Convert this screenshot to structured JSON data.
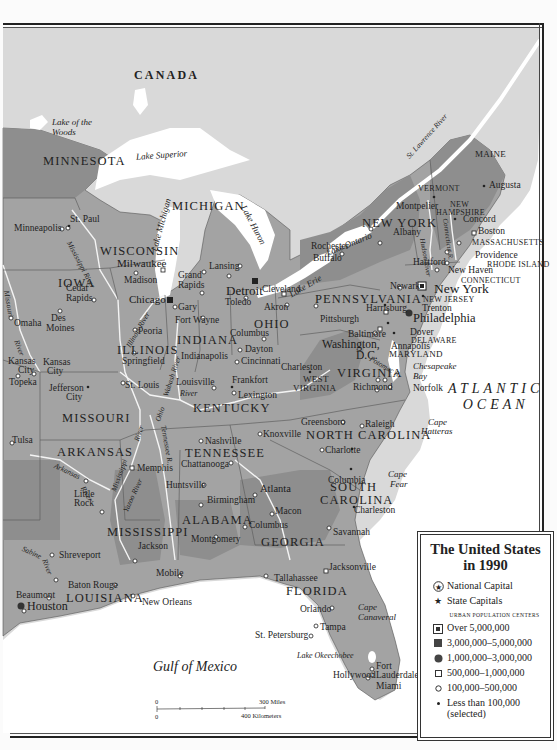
{
  "title_lines": [
    "The United States",
    "in 1990"
  ],
  "colors": {
    "foreign_land": "#d9d9d9",
    "us_land": "#a2a2a2",
    "us_land_dark": "#8d8d8d",
    "water": "#ffffff",
    "border": "#222222"
  },
  "countries": [
    {
      "name": "CANADA"
    }
  ],
  "oceans": [
    {
      "name": "ATLANTIC OCEAN",
      "lines": [
        "ATLANTIC",
        "OCEAN"
      ]
    },
    {
      "name": "Gulf of Mexico"
    }
  ],
  "water_labels": [
    "Lake of the Woods",
    "Lake Superior",
    "Lake Michigan",
    "Lake Huron",
    "Lake Ontario",
    "Lake Erie",
    "St. Lawrence River",
    "Mississippi River",
    "Missouri River",
    "Illinois River",
    "Wabash River",
    "Ohio River",
    "Tennessee R.",
    "Arkansas River",
    "Yazoo River",
    "Sabine River",
    "Potomac R.",
    "Hudson River",
    "Connecticut R.",
    "Chesapeake Bay",
    "Cape Hatteras",
    "Cape Fear",
    "Cape Canaveral",
    "Lake Okeechobee"
  ],
  "states": [
    "MINNESOTA",
    "WISCONSIN",
    "MICHIGAN",
    "IOWA",
    "ILLINOIS",
    "INDIANA",
    "OHIO",
    "PENNSYLVANIA",
    "NEW YORK",
    "VERMONT",
    "NEW HAMPSHIRE",
    "MAINE",
    "MASSACHUSETTS",
    "RHODE ISLAND",
    "CONNECTICUT",
    "NEW JERSEY",
    "DELAWARE",
    "MARYLAND",
    "WEST VIRGINIA",
    "VIRGINIA",
    "KENTUCKY",
    "MISSOURI",
    "ARKANSAS",
    "TENNESSEE",
    "NORTH CAROLINA",
    "SOUTH CAROLINA",
    "GEORGIA",
    "ALABAMA",
    "MISSISSIPPI",
    "LOUISIANA",
    "FLORIDA"
  ],
  "cities": {
    "national_capital": [
      "Washington, D.C."
    ],
    "state_capitals": [
      "St. Paul",
      "Madison",
      "Lansing",
      "Des Moines",
      "Springfield",
      "Indianapolis",
      "Columbus",
      "Harrisburg",
      "Albany",
      "Montpelier",
      "Concord",
      "Augusta",
      "Boston",
      "Providence",
      "Hartford",
      "Trenton",
      "Dover",
      "Annapolis",
      "Charleston",
      "Richmond",
      "Frankfort",
      "Jefferson City",
      "Topeka",
      "Little Rock",
      "Nashville",
      "Raleigh",
      "Columbia",
      "Atlanta",
      "Montgomery",
      "Jackson",
      "Baton Rouge",
      "Tallahassee"
    ],
    "over_5m": [
      "New York"
    ],
    "3m_to_5m": [
      "Chicago",
      "Detroit"
    ],
    "1m_to_3m": [
      "Philadelphia",
      "Houston"
    ],
    "others": [
      "Minneapolis",
      "Milwaukee",
      "Grand Rapids",
      "Cedar Rapids",
      "Omaha",
      "Kansas City",
      "Gary",
      "Fort Wayne",
      "Peoria",
      "St. Louis",
      "Toledo",
      "Cleveland",
      "Akron",
      "Dayton",
      "Cincinnati",
      "Louisville",
      "Lexington",
      "Pittsburgh",
      "Rochester",
      "Buffalo",
      "Newark",
      "New Haven",
      "Baltimore",
      "Norfolk",
      "Greensboro",
      "Charlotte",
      "Knoxville",
      "Chattanooga",
      "Memphis",
      "Huntsville",
      "Birmingham",
      "Macon",
      "Savannah",
      "Jacksonville",
      "Mobile",
      "New Orleans",
      "Shreveport",
      "Beaumont",
      "Tulsa",
      "Orlando",
      "Tampa",
      "St. Petersburg",
      "Fort Lauderdale",
      "Hollywood",
      "Miami"
    ]
  },
  "labels": {
    "canada": "CANADA",
    "atl1": "ATLANTIC",
    "atl2": "OCEAN",
    "gulf": "Gulf of Mexico",
    "lake_woods1": "Lake of the",
    "lake_woods2": "Woods",
    "lake_superior": "Lake Superior",
    "lake_michigan": "Lake Michigan",
    "lake_huron": "Lake Huron",
    "lake_ontario": "Lake Ontario",
    "lake_erie": "Lake Erie",
    "st_lawrence": "St. Lawrence River",
    "mississippi_r": "Mississippi River",
    "mississippi_r2": "Mississippi",
    "missouri_r": "Missouri",
    "river": "River",
    "illinois_r": "Illinois River",
    "wabash_r": "Wabash River",
    "ohio_r": "Ohio",
    "tennessee_r": "Tennessee R.",
    "arkansas_r": "Arkansas",
    "yazoo_r": "Yazoo River",
    "sabine_r": "Sabine",
    "potomac_r": "Potomac R.",
    "hudson_r": "Hudson River",
    "connecticut_r": "Connecticut R.",
    "chesapeake1": "Chesapeake",
    "chesapeake2": "Bay",
    "hatteras1": "Cape",
    "hatteras2": "Hatteras",
    "fear1": "Cape",
    "fear2": "Fear",
    "canaveral1": "Cape",
    "canaveral2": "Canaveral",
    "okeechobee": "Lake Okeechobee",
    "s_mn": "MINNESOTA",
    "s_wi": "WISCONSIN",
    "s_mi": "MICHIGAN",
    "s_ia": "IOWA",
    "s_il": "ILLINOIS",
    "s_in": "INDIANA",
    "s_oh": "OHIO",
    "s_pa": "PENNSYLVANIA",
    "s_ny": "NEW YORK",
    "s_vt": "VERMONT",
    "s_nh1": "NEW",
    "s_nh2": "HAMPSHIRE",
    "s_me": "MAINE",
    "s_ma": "MASSACHUSETTS",
    "s_ri": "RHODE ISLAND",
    "s_ct": "CONNECTICUT",
    "s_nj": "NEW JERSEY",
    "s_de": "DELAWARE",
    "s_md": "MARYLAND",
    "s_wv1": "WEST",
    "s_wv2": "VIRGINIA",
    "s_va": "VIRGINIA",
    "s_ky": "KENTUCKY",
    "s_mo": "MISSOURI",
    "s_ar": "ARKANSAS",
    "s_tn": "TENNESSEE",
    "s_nc": "NORTH CAROLINA",
    "s_sc1": "SOUTH",
    "s_sc2": "CAROLINA",
    "s_ga": "GEORGIA",
    "s_al": "ALABAMA",
    "s_ms": "MISSISSIPPI",
    "s_la": "LOUISIANA",
    "s_fl": "FLORIDA",
    "c_stpaul": "St. Paul",
    "c_minneapolis": "Minneapolis",
    "c_milwaukee": "Milwaukee",
    "c_madison": "Madison",
    "c_chicago": "Chicago",
    "c_grandrapids1": "Grand",
    "c_grandrapids2": "Rapids",
    "c_lansing": "Lansing",
    "c_detroit": "Detroit",
    "c_cedar1": "Cedar",
    "c_cedar2": "Rapids",
    "c_desmoines1": "Des",
    "c_desmoines2": "Moines",
    "c_omaha": "Omaha",
    "c_kc1": "Kansas",
    "c_kc2": "City",
    "c_topeka": "Topeka",
    "c_jeffcity1": "Jefferson",
    "c_jeffcity2": "City",
    "c_gary": "Gary",
    "c_fortwayne": "Fort Wayne",
    "c_peoria": "Peoria",
    "c_springfield": "Springfield",
    "c_stlouis": "St. Louis",
    "c_indianapolis": "Indianapolis",
    "c_toledo": "Toledo",
    "c_cleveland": "Cleveland",
    "c_akron": "Akron",
    "c_columbus": "Columbus",
    "c_dayton": "Dayton",
    "c_cincinnati": "Cincinnati",
    "c_louisville": "Louisville",
    "c_frankfort": "Frankfort",
    "c_lexington": "Lexington",
    "c_pittsburgh": "Pittsburgh",
    "c_harrisburg": "Harrisburg",
    "c_rochester": "Rochester",
    "c_buffalo": "Buffalo",
    "c_albany": "Albany",
    "c_montpelier": "Montpelier",
    "c_concord": "Concord",
    "c_augusta": "Augusta",
    "c_boston": "Boston",
    "c_providence": "Providence",
    "c_hartford": "Hartford",
    "c_newhaven": "New Haven",
    "c_newark": "Newark",
    "c_newyork": "New York",
    "c_trenton": "Trenton",
    "c_philadelphia": "Philadelphia",
    "c_dover": "Dover",
    "c_baltimore": "Baltimore",
    "c_annapolis": "Annapolis",
    "c_washington1": "Washington,",
    "c_washington2": "D.C.",
    "c_charleston_wv": "Charleston",
    "c_richmond": "Richmond",
    "c_norfolk": "Norfolk",
    "c_greensboro": "Greensboro",
    "c_raleigh": "Raleigh",
    "c_charlotte": "Charlotte",
    "c_knoxville": "Knoxville",
    "c_nashville": "Nashville",
    "c_chattanooga": "Chattanooga",
    "c_memphis": "Memphis",
    "c_huntsville": "Huntsville",
    "c_birmingham": "Birmingham",
    "c_atlanta": "Atlanta",
    "c_macon": "Macon",
    "c_columbus_ga": "Columbus",
    "c_montgomery": "Montgomery",
    "c_columbia": "Columbia",
    "c_charleston_sc": "Charleston",
    "c_savannah": "Savannah",
    "c_jacksonville": "Jacksonville",
    "c_tallahassee": "Tallahassee",
    "c_orlando": "Orlando",
    "c_tampa": "Tampa",
    "c_stpete": "St. Petersburg",
    "c_ftl1": "Fort",
    "c_ftl2": "Lauderdale",
    "c_hollywood": "Hollywood",
    "c_miami": "Miami",
    "c_tulsa": "Tulsa",
    "c_littlerock1": "Little",
    "c_littlerock2": "Rock",
    "c_shreveport": "Shreveport",
    "c_jackson": "Jackson",
    "c_mobile": "Mobile",
    "c_neworleans": "New Orleans",
    "c_batonrouge": "Baton Rouge",
    "c_beaumont": "Beaumont",
    "c_houston": "Houston"
  },
  "legend": {
    "items": [
      {
        "symbol": "national-capital",
        "label": "National Capital"
      },
      {
        "symbol": "state-capital",
        "label": "State Capitals"
      }
    ],
    "subheading": "URBAN POPULATION CENTERS",
    "population": [
      {
        "symbol": "square-in-square",
        "label": "Over 5,000,000"
      },
      {
        "symbol": "filled-square",
        "label": "3,000,000–5,000,000"
      },
      {
        "symbol": "filled-circle",
        "label": "1,000,000–3,000,000"
      },
      {
        "symbol": "open-square",
        "label": "500,000–1,000,000"
      },
      {
        "symbol": "open-circle",
        "label": "100,000–500,000"
      },
      {
        "symbol": "dot",
        "label": "Less than 100,000",
        "label2": "(selected)"
      }
    ]
  },
  "scale_bar": {
    "zero_top": "0",
    "zero_bottom": "0",
    "miles": "300 Miles",
    "kilometers": "400 Kilometers"
  }
}
